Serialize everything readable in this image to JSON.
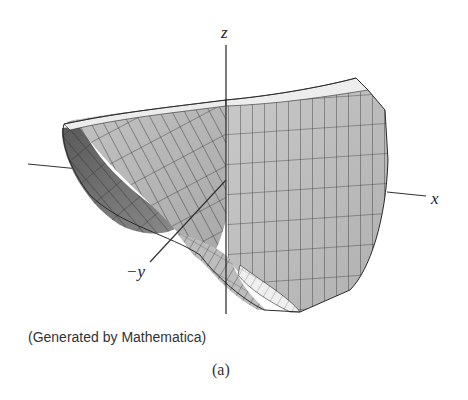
{
  "figure": {
    "axes": {
      "z": "z",
      "x": "x",
      "y": "−y"
    },
    "caption": "(Generated by Mathematica)",
    "sublabel": "(a)",
    "surface": {
      "description": "3D mesh surface plot (hyperbolic-paraboloid-like saddle/trough) with quadrilateral grid",
      "fill_light": "#d6d6d6",
      "fill_mid": "#b4b4b4",
      "fill_dark": "#6e6e6e",
      "edge_color": "#2a2a2a"
    }
  }
}
